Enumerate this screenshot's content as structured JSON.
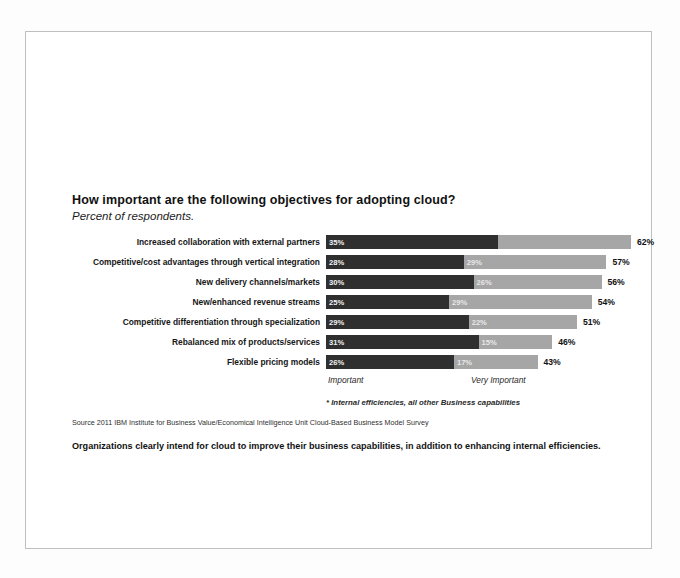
{
  "slide": {
    "title": "How important are the following objectives for adopting cloud?",
    "subtitle": "Percent of respondents.",
    "footnote": "* Internal efficiencies, all other Business capabilities",
    "source": "Source 2011 IBM Institute for Business Value/Economical Intelligence Unit Cloud-Based Business Model Survey",
    "conclusion": "Organizations clearly intend for cloud to improve their business capabilities, in addition to enhancing internal efficiencies."
  },
  "colors": {
    "important": "#2f2f2f",
    "very_important": "#a6a6a6",
    "text": "#111111",
    "frame": "#bfbfbf"
  },
  "chart_data": {
    "type": "bar",
    "orientation": "horizontal",
    "stacked": true,
    "title": "How important are the following objectives for adopting cloud?",
    "subtitle": "Percent of respondents.",
    "xlabel": "",
    "ylabel": "",
    "xlim": [
      0,
      62
    ],
    "grid": false,
    "legend_position": "below-axis-inline",
    "categories": [
      "Increased collaboration with external partners",
      "Competitive/cost advantages through vertical integration",
      "New delivery channels/markets",
      "New/enhanced revenue streams",
      "Competitive differentiation through specialization",
      "Rebalanced mix of products/services",
      "Flexible pricing models"
    ],
    "series": [
      {
        "name": "Important",
        "values": [
          35,
          28,
          30,
          25,
          29,
          31,
          26
        ]
      },
      {
        "name": "Very Important",
        "values": [
          27,
          29,
          26,
          29,
          22,
          15,
          17
        ]
      }
    ],
    "totals": [
      62,
      57,
      56,
      54,
      51,
      46,
      43
    ],
    "value_suffix": "%",
    "rows": [
      {
        "label": "Increased collaboration with external partners",
        "important": 35,
        "important_label": "35%",
        "very_important": 27,
        "very_important_label": "27%",
        "total": 62,
        "total_label": "62%"
      },
      {
        "label": "Competitive/cost advantages through vertical integration",
        "important": 28,
        "important_label": "28%",
        "very_important": 29,
        "very_important_label": "29%",
        "total": 57,
        "total_label": "57%"
      },
      {
        "label": "New delivery channels/markets",
        "important": 30,
        "important_label": "30%",
        "very_important": 26,
        "very_important_label": "26%",
        "total": 56,
        "total_label": "56%"
      },
      {
        "label": "New/enhanced revenue streams",
        "important": 25,
        "important_label": "25%",
        "very_important": 29,
        "very_important_label": "29%",
        "total": 54,
        "total_label": "54%"
      },
      {
        "label": "Competitive differentiation through specialization",
        "important": 29,
        "important_label": "29%",
        "very_important": 22,
        "very_important_label": "22%",
        "total": 51,
        "total_label": "51%"
      },
      {
        "label": "Rebalanced mix of products/services",
        "important": 31,
        "important_label": "31%",
        "very_important": 15,
        "very_important_label": "15%",
        "total": 46,
        "total_label": "46%"
      },
      {
        "label": "Flexible pricing models",
        "important": 26,
        "important_label": "26%",
        "very_important": 17,
        "very_important_label": "17%",
        "total": 43,
        "total_label": "43%"
      }
    ],
    "legend": [
      {
        "name": "Important",
        "color": "#2f2f2f"
      },
      {
        "name": "Very Important",
        "color": "#a6a6a6"
      }
    ]
  }
}
